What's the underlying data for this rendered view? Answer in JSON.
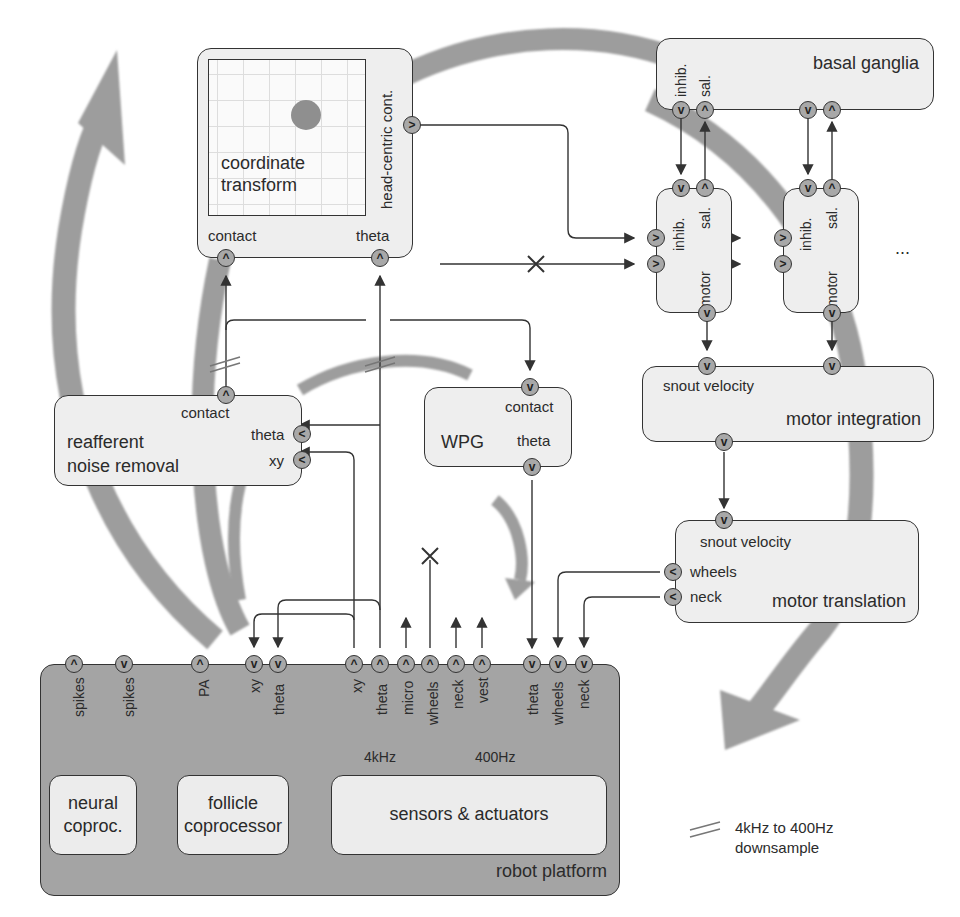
{
  "modules": {
    "coordinate_transform": {
      "title_line1": "coordinate",
      "title_line2": "transform",
      "port_head": "head-centric cont.",
      "port_contact": "contact",
      "port_theta": "theta"
    },
    "basal_ganglia": {
      "title": "basal ganglia",
      "port_inhib": "inhib.",
      "port_sal": "sal."
    },
    "action_channel_1": {
      "port_inhib": "inhib.",
      "port_sal": "sal.",
      "port_motor": "motor"
    },
    "action_channel_2": {
      "port_inhib": "inhib.",
      "port_sal": "sal.",
      "port_motor": "motor"
    },
    "ellipsis": "...",
    "motor_integration": {
      "title": "motor integration",
      "port_snout": "snout velocity"
    },
    "motor_translation": {
      "title": "motor translation",
      "port_snout": "snout velocity",
      "port_wheels": "wheels",
      "port_neck": "neck"
    },
    "reafferent": {
      "title_line1": "reafferent",
      "title_line2": "noise removal",
      "port_contact": "contact",
      "port_theta": "theta",
      "port_xy": "xy"
    },
    "wpg": {
      "title": "WPG",
      "port_contact": "contact",
      "port_theta": "theta"
    },
    "robot_platform": {
      "title": "robot platform",
      "ports": [
        "spikes",
        "spikes",
        "PA",
        "xy",
        "theta",
        "xy",
        "theta",
        "micro",
        "wheels",
        "neck",
        "vest",
        "theta",
        "wheels",
        "neck"
      ],
      "rate_4k": "4kHz",
      "rate_400": "400Hz",
      "sub_neural_line1": "neural",
      "sub_neural_line2": "coproc.",
      "sub_follicle_line1": "follicle",
      "sub_follicle_line2": "coprocessor",
      "sub_sensors": "sensors & actuators"
    }
  },
  "legend": {
    "line1": "4kHz to 400Hz",
    "line2": "downsample"
  },
  "glyphs": {
    "up": "^",
    "down": "v",
    "right": ">",
    "left": "<"
  },
  "colors": {
    "flow_arrow": "#9a9a9a",
    "box": "#eeeeee",
    "platform": "#a4a4a4",
    "port": "#a8a8a8",
    "line": "#333333"
  }
}
